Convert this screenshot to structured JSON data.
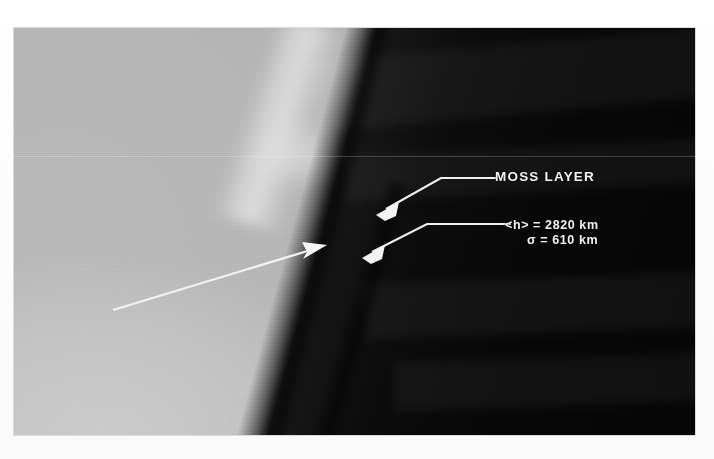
{
  "figure": {
    "name": "solar-limb-moss-layer-image",
    "frame_color": "#ffffff",
    "plate_background": "#0a0a0a"
  },
  "annotations": {
    "moss_layer_label": "MOSS LAYER",
    "mean_height_label": "<h> = 2820 km",
    "sigma_label": "σ = 610 km",
    "annotation_color": "#f2f2f2"
  },
  "measurements": {
    "mean_height_value": 2820,
    "mean_height_unit": "km",
    "sigma_value": 610,
    "sigma_unit": "km"
  },
  "regions": {
    "solar_disk_label": "solar-disk-bright-region",
    "off_limb_sky_label": "off-limb-dark-sky",
    "dark_lane_label": "limb-dark-absorption-lane"
  },
  "pointers": {
    "moss_leader": "leader-line-to-moss-layer",
    "height_leader": "leader-line-to-height-measurement",
    "diagonal_pointer": "long-diagonal-arrow-to-limb"
  }
}
